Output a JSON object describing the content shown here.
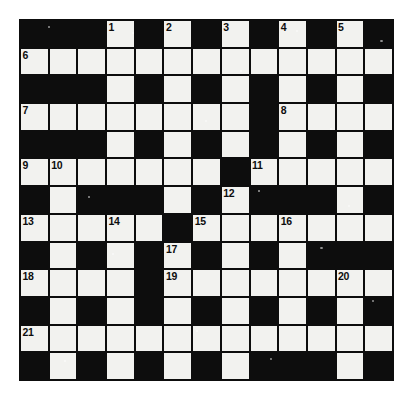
{
  "puzzle": {
    "type": "crossword-grid",
    "columns": 13,
    "rows": 13,
    "colors": {
      "block": "#0d0d0d",
      "open": "#f2f2ef",
      "number": "#0d0d0d",
      "page": "#ffffff"
    },
    "legend": {
      "block": "filled/black square",
      "open": "empty/white answer square"
    },
    "grid": [
      [
        "block",
        "block",
        "block",
        "open",
        "block",
        "open",
        "block",
        "open",
        "block",
        "open",
        "block",
        "open",
        "block"
      ],
      [
        "open",
        "open",
        "open",
        "open",
        "open",
        "open",
        "open",
        "open",
        "open",
        "open",
        "open",
        "open",
        "open"
      ],
      [
        "block",
        "block",
        "block",
        "open",
        "block",
        "open",
        "block",
        "open",
        "block",
        "open",
        "block",
        "open",
        "block"
      ],
      [
        "open",
        "open",
        "open",
        "open",
        "open",
        "open",
        "open",
        "open",
        "block",
        "open",
        "open",
        "open",
        "open"
      ],
      [
        "block",
        "block",
        "block",
        "open",
        "block",
        "open",
        "block",
        "open",
        "block",
        "open",
        "block",
        "open",
        "block"
      ],
      [
        "open",
        "open",
        "open",
        "open",
        "open",
        "open",
        "open",
        "block",
        "open",
        "open",
        "open",
        "open",
        "open"
      ],
      [
        "block",
        "open",
        "block",
        "block",
        "block",
        "open",
        "block",
        "open",
        "block",
        "block",
        "block",
        "open",
        "block"
      ],
      [
        "open",
        "open",
        "open",
        "open",
        "open",
        "block",
        "open",
        "open",
        "open",
        "open",
        "open",
        "open",
        "open"
      ],
      [
        "block",
        "open",
        "block",
        "open",
        "block",
        "open",
        "block",
        "open",
        "block",
        "open",
        "block",
        "block",
        "block"
      ],
      [
        "open",
        "open",
        "open",
        "open",
        "block",
        "open",
        "open",
        "open",
        "open",
        "open",
        "open",
        "open",
        "open"
      ],
      [
        "block",
        "open",
        "block",
        "open",
        "block",
        "open",
        "block",
        "open",
        "block",
        "open",
        "block",
        "open",
        "block"
      ],
      [
        "open",
        "open",
        "open",
        "open",
        "open",
        "open",
        "open",
        "open",
        "open",
        "open",
        "open",
        "open",
        "open"
      ],
      [
        "block",
        "open",
        "block",
        "open",
        "block",
        "open",
        "block",
        "open",
        "block",
        "block",
        "block",
        "open",
        "block"
      ]
    ],
    "numbers": [
      {
        "row": 0,
        "col": 3,
        "label": "1"
      },
      {
        "row": 0,
        "col": 5,
        "label": "2"
      },
      {
        "row": 0,
        "col": 7,
        "label": "3"
      },
      {
        "row": 0,
        "col": 9,
        "label": "4"
      },
      {
        "row": 0,
        "col": 11,
        "label": "5"
      },
      {
        "row": 1,
        "col": 0,
        "label": "6"
      },
      {
        "row": 3,
        "col": 0,
        "label": "7"
      },
      {
        "row": 3,
        "col": 9,
        "label": "8"
      },
      {
        "row": 5,
        "col": 0,
        "label": "9"
      },
      {
        "row": 5,
        "col": 1,
        "label": "10"
      },
      {
        "row": 5,
        "col": 8,
        "label": "11"
      },
      {
        "row": 6,
        "col": 7,
        "label": "12"
      },
      {
        "row": 7,
        "col": 0,
        "label": "13"
      },
      {
        "row": 7,
        "col": 3,
        "label": "14"
      },
      {
        "row": 7,
        "col": 6,
        "label": "15"
      },
      {
        "row": 7,
        "col": 9,
        "label": "16"
      },
      {
        "row": 8,
        "col": 5,
        "label": "17"
      },
      {
        "row": 9,
        "col": 0,
        "label": "18"
      },
      {
        "row": 9,
        "col": 5,
        "label": "19"
      },
      {
        "row": 9,
        "col": 11,
        "label": "20"
      },
      {
        "row": 11,
        "col": 0,
        "label": "21"
      }
    ]
  }
}
